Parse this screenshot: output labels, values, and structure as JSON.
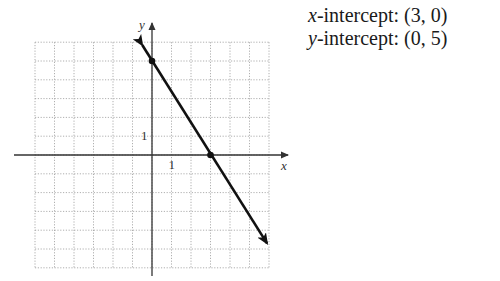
{
  "info": {
    "x_intercept": {
      "var": "x",
      "label": "-intercept: ",
      "value": "(3, 0)"
    },
    "y_intercept": {
      "var": "y",
      "label": "-intercept: ",
      "value": "(0, 5)"
    }
  },
  "colors": {
    "grid": "#9a9a9a",
    "axis": "#333333",
    "line": "#111111"
  },
  "chart_data": {
    "type": "line",
    "title": "",
    "xlabel": "x",
    "ylabel": "y",
    "xlim": [
      -6,
      6
    ],
    "ylim": [
      -6,
      6
    ],
    "grid": true,
    "grid_style": "dotted",
    "tick_labels": {
      "x": [
        "1"
      ],
      "y": [
        "1"
      ]
    },
    "series": [
      {
        "name": "line through intercepts",
        "equation": "y = -5/3 x + 5",
        "points": [
          [
            0,
            5
          ],
          [
            3,
            0
          ]
        ],
        "extends_with_arrows": true,
        "arrow_start": [
          -0.5,
          5.85
        ],
        "arrow_end": [
          5.9,
          -4.7
        ]
      }
    ],
    "annotations": [
      "x-intercept: (3, 0)",
      "y-intercept: (0, 5)"
    ],
    "legend": null
  }
}
